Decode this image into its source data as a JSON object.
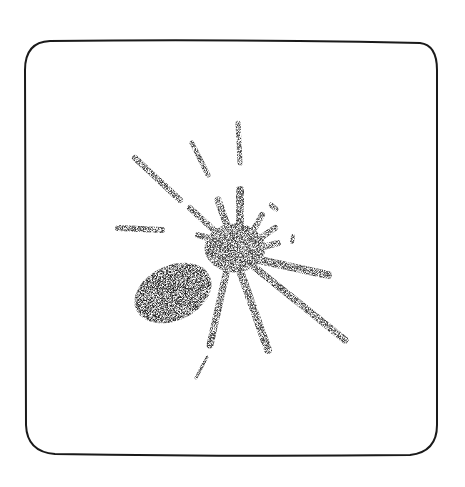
{
  "illustration": {
    "subject": "spider",
    "style": "stippled-halftone",
    "frame": {
      "shape": "rounded-square",
      "stroke": "#1a1a1a",
      "fill": "#ffffff"
    },
    "ink_color": "#3a3a3a"
  }
}
